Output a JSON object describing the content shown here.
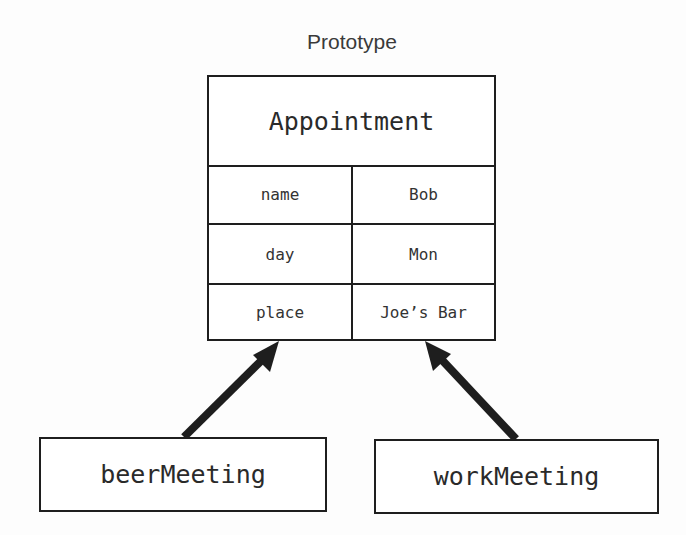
{
  "diagram": {
    "caption": "Prototype",
    "prototype": {
      "title": "Appointment",
      "fields": [
        {
          "key": "name",
          "value": "Bob"
        },
        {
          "key": "day",
          "value": "Mon"
        },
        {
          "key": "place",
          "value": "Joe’s Bar"
        }
      ]
    },
    "objects": [
      {
        "label": "beerMeeting"
      },
      {
        "label": "workMeeting"
      }
    ],
    "arrows": [
      {
        "from": "beerMeeting",
        "to": "Appointment",
        "type": "inherits-from-prototype"
      },
      {
        "from": "workMeeting",
        "to": "Appointment",
        "type": "inherits-from-prototype"
      }
    ],
    "colors": {
      "stroke": "#1e1e1e",
      "text": "#2a2a2a",
      "background": "#fdfdfd"
    }
  }
}
